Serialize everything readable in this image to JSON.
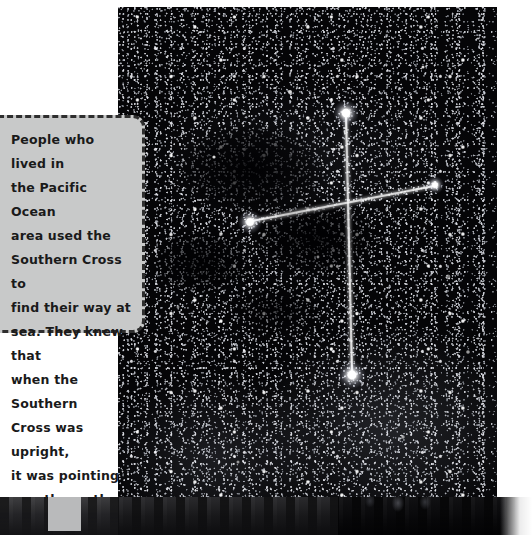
{
  "page": {
    "type": "textbook-page-spread",
    "background_color": "#ffffff"
  },
  "caption": {
    "name": "southern-cross-navigation-caption",
    "text": "People who lived in\nthe Pacific Ocean\narea used the\nSouthern Cross to\nfind their way at\nsea. They knew that\nwhen the Southern\nCross was upright,\nit was pointing\nexactly south.",
    "lines": [
      "People who lived in",
      "the Pacific Ocean",
      "area used the",
      "Southern Cross to",
      "find their way at",
      "sea. They knew that",
      "when the Southern",
      "Cross was upright,",
      "it was pointing",
      "exactly south."
    ],
    "background_color": "#c8c9c9",
    "border_color": "#2e2e2e",
    "border_style": "dashed",
    "text_color": "#1a1a1a"
  },
  "photo": {
    "name": "southern-cross-night-sky-photograph",
    "alt": "Night sky photograph of the Southern Cross constellation drawn as a bright cross over a dense star field with a dark nebula",
    "background_color": "#050507",
    "overlay": {
      "shape": "cross",
      "color": "#ffffff",
      "stars": [
        {
          "name": "top-star",
          "x": 228,
          "y": 106
        },
        {
          "name": "left-star",
          "x": 132,
          "y": 215
        },
        {
          "name": "right-star",
          "x": 317,
          "y": 178
        },
        {
          "name": "bottom-star",
          "x": 234,
          "y": 368
        }
      ],
      "intersection": {
        "x": 229,
        "y": 193
      }
    },
    "features": [
      {
        "name": "coalsack-nebula",
        "description": "dark dust cloud below the cross"
      },
      {
        "name": "milky-way-band",
        "description": "bright star clouds lower right"
      }
    ]
  },
  "bottom_strip": {
    "name": "page-edge-shadow-strip",
    "colors": {
      "dark": "#0b0b0d",
      "mid": "#18181a",
      "light_block": "#b9babb",
      "edge_white": "#ffffff"
    }
  }
}
